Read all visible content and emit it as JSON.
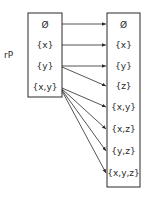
{
  "diagram": {
    "side_label": "rP",
    "left_set": [
      "Ø",
      "{x}",
      "{y}",
      "{x,y}"
    ],
    "right_set": [
      "Ø",
      "{x}",
      "{y}",
      "{z}",
      "{x,y}",
      "{x,z}",
      "{y,z}",
      "{x,y,z}"
    ],
    "arrows": [
      {
        "from": "Ø",
        "to": "Ø"
      },
      {
        "from": "{x}",
        "to": "{x}"
      },
      {
        "from": "{y}",
        "to": "{y}"
      },
      {
        "from": "{y}",
        "to": "{z}"
      },
      {
        "from": "{x,y}",
        "to": "{x,y}"
      },
      {
        "from": "{x,y}",
        "to": "{x,z}"
      },
      {
        "from": "{x,y}",
        "to": "{y,z}"
      },
      {
        "from": "{x,y}",
        "to": "{x,y,z}"
      }
    ],
    "colors": {
      "ink": "#2a2a2a",
      "background": "#ffffff"
    }
  }
}
